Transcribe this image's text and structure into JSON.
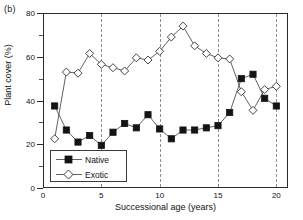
{
  "panel": {
    "label": "(b)"
  },
  "chart_data": {
    "type": "line",
    "title": "",
    "xlabel": "Successional age (years)",
    "ylabel": "Plant cover (%)",
    "xlim": [
      0,
      21
    ],
    "ylim": [
      0,
      80
    ],
    "xticks": [
      0,
      5,
      10,
      15,
      20
    ],
    "yticks": [
      0,
      20,
      40,
      60,
      80
    ],
    "grid": "vertical-dashed-at-5-10-15-20",
    "gridlines_x": [
      5,
      10,
      15,
      20
    ],
    "legend_position": "lower-left-inside",
    "x": [
      1,
      2,
      3,
      4,
      5,
      6,
      7,
      8,
      9,
      10,
      11,
      12,
      13,
      14,
      15,
      16,
      17,
      18,
      19,
      20
    ],
    "series": [
      {
        "name": "Native",
        "marker": "filled-square",
        "color": "#141414",
        "values": [
          37.5,
          26.5,
          21.0,
          24.0,
          19.5,
          25.5,
          29.5,
          27.5,
          33.5,
          27.0,
          22.5,
          26.5,
          26.5,
          27.5,
          28.5,
          34.5,
          50.0,
          52.0,
          41.0,
          37.5
        ]
      },
      {
        "name": "Exotic",
        "marker": "open-diamond",
        "color": "#ffffff",
        "values": [
          22.5,
          53.0,
          52.5,
          61.5,
          56.5,
          55.0,
          53.5,
          59.5,
          58.5,
          62.5,
          69.0,
          74.0,
          65.0,
          61.5,
          59.5,
          59.0,
          44.0,
          35.5,
          45.0,
          46.5
        ]
      }
    ]
  },
  "legend": {
    "items": [
      {
        "label": "Native",
        "marker": "filled-square"
      },
      {
        "label": "Exotic",
        "marker": "open-diamond"
      }
    ]
  }
}
